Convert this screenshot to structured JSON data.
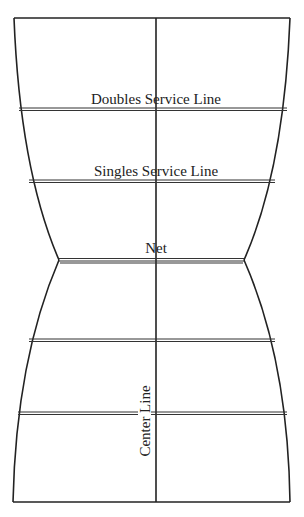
{
  "diagram": {
    "labels": {
      "doubles_service_line": "Doubles Service Line",
      "singles_service_line": "Singles Service Line",
      "net": "Net",
      "center_line": "Center Line"
    },
    "colors": {
      "line": "#222222",
      "background": "#ffffff"
    }
  }
}
